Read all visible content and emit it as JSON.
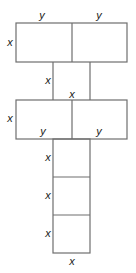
{
  "figure": {
    "line_color": "#6e6e6e",
    "label_color": "#1a1a1a",
    "labels": {
      "top_left_y": "y",
      "top_right_y": "y",
      "top_rect_height_x": "x",
      "column_upper_x": "x",
      "column_upper_width_x": "x",
      "second_rect_height_x": "x",
      "second_left_y": "y",
      "second_right_y": "y",
      "lower_box1_x": "x",
      "lower_box2_x": "x",
      "lower_box3_x": "x",
      "bottom_width_x": "x"
    }
  }
}
